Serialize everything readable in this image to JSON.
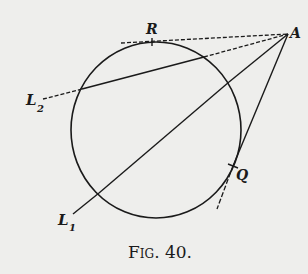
{
  "figure": {
    "caption_main": "F",
    "caption_smallcaps": "IG",
    "caption_rest": ". 40.",
    "caption_full": "Fig. 40."
  },
  "labels": {
    "A": "A",
    "R": "R",
    "Q": "Q",
    "L1_main": "L",
    "L1_sub": "1",
    "L2_main": "L",
    "L2_sub": "2"
  },
  "colors": {
    "ink": "#1a1a1a",
    "paper": "#eeeeec"
  },
  "geometry": {
    "circle": {
      "cx": 156,
      "cy": 130,
      "rx": 85,
      "ry": 88
    },
    "point_A": [
      288,
      34
    ],
    "tangent_R": {
      "from": [
        121,
        43
      ],
      "to": [
        288,
        34
      ],
      "tick": [
        152,
        42
      ]
    },
    "secant_L2": {
      "start": [
        43,
        99
      ],
      "enter": [
        82,
        89
      ],
      "exit": [
        204,
        57
      ],
      "end": [
        288,
        34
      ]
    },
    "secant_L1": {
      "start": [
        73,
        214
      ],
      "enter": [
        99,
        193
      ],
      "exit": [
        229,
        82
      ],
      "end": [
        288,
        34
      ]
    },
    "tangent_Q": {
      "from": [
        288,
        34
      ],
      "to": [
        217,
        209
      ],
      "tick": [
        233,
        166
      ]
    }
  }
}
